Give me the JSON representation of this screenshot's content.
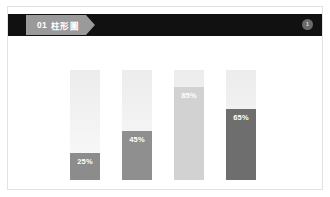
{
  "slide": {
    "header": {
      "tag_number": "01",
      "tag_title": "柱形圖",
      "badge_label": "1",
      "band_color": "#111111",
      "tag_color": "#9a9a9a"
    }
  },
  "chart_data": {
    "type": "bar",
    "title": "01 柱形圖",
    "xlabel": "",
    "ylabel": "",
    "ylim": [
      0,
      100
    ],
    "grid": false,
    "legend": "none",
    "orientation": "vertical",
    "categories": [
      "1",
      "2",
      "3",
      "4"
    ],
    "values": [
      25,
      45,
      85,
      65
    ],
    "labels": [
      "25%",
      "45%",
      "85%",
      "65%"
    ],
    "colors": [
      "#8c8c8c",
      "#8f8f8f",
      "#d2d2d2",
      "#6e6e6e"
    ],
    "track_color": "#f1f1f1",
    "bars": [
      {
        "label": "25%",
        "value": 25,
        "color": "#8c8c8c"
      },
      {
        "label": "45%",
        "value": 45,
        "color": "#8f8f8f"
      },
      {
        "label": "85%",
        "value": 85,
        "color": "#d2d2d2"
      },
      {
        "label": "65%",
        "value": 65,
        "color": "#6e6e6e"
      }
    ]
  }
}
